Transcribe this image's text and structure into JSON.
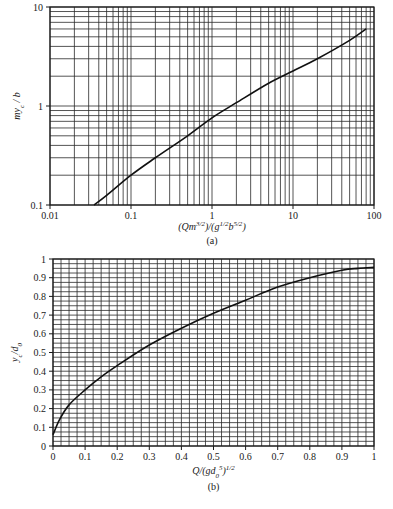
{
  "chart_data": [
    {
      "id": "a",
      "type": "line",
      "caption": "(a)",
      "xscale": "log",
      "yscale": "log",
      "xlim": [
        0.01,
        100
      ],
      "ylim": [
        0.1,
        10
      ],
      "xlabel": "(Qm^{3/2})/(g^{1/2}b^{5/2})",
      "xlabel_parts": [
        {
          "t": "(Qm",
          "s": "n"
        },
        {
          "t": "3/2",
          "s": "sup"
        },
        {
          "t": ")/(g",
          "s": "n"
        },
        {
          "t": "1/2",
          "s": "sup"
        },
        {
          "t": "b",
          "s": "n"
        },
        {
          "t": "5/2",
          "s": "sup"
        },
        {
          "t": ")",
          "s": "n"
        }
      ],
      "ylabel": "my_c / b",
      "ylabel_parts": [
        {
          "t": "my",
          "s": "n"
        },
        {
          "t": "c",
          "s": "sub"
        },
        {
          "t": " / b",
          "s": "n"
        }
      ],
      "xticks": [
        0.01,
        0.1,
        1,
        10,
        100
      ],
      "xtick_labels": [
        "0.01",
        "0.1",
        "1",
        "10",
        "100"
      ],
      "yticks": [
        0.1,
        1,
        10
      ],
      "ytick_labels": [
        "0.1",
        "1",
        "10"
      ],
      "grid": true,
      "series": [
        {
          "name": "my_c/b",
          "x": [
            0.035,
            0.05,
            0.1,
            0.2,
            0.5,
            1,
            2,
            5,
            10,
            20,
            50,
            80
          ],
          "y": [
            0.1,
            0.125,
            0.2,
            0.3,
            0.5,
            0.76,
            1.08,
            1.7,
            2.26,
            3.0,
            4.6,
            6.0
          ]
        }
      ]
    },
    {
      "id": "b",
      "type": "line",
      "caption": "(b)",
      "xscale": "linear",
      "yscale": "linear",
      "xlim": [
        0,
        1
      ],
      "ylim": [
        0,
        1
      ],
      "xlabel": "Q/(gd_0^5)^{1/2}",
      "xlabel_parts": [
        {
          "t": "Q/(gd",
          "s": "n"
        },
        {
          "t": "0",
          "s": "sub"
        },
        {
          "t": "5",
          "s": "sup"
        },
        {
          "t": ")",
          "s": "n"
        },
        {
          "t": "1/2",
          "s": "sup"
        }
      ],
      "ylabel": "y_c/d_0",
      "ylabel_parts": [
        {
          "t": "y",
          "s": "n"
        },
        {
          "t": "c",
          "s": "sub"
        },
        {
          "t": "/d",
          "s": "n"
        },
        {
          "t": "0",
          "s": "sub"
        }
      ],
      "xticks": [
        0,
        0.1,
        0.2,
        0.3,
        0.4,
        0.5,
        0.6,
        0.7,
        0.8,
        0.9,
        1
      ],
      "xtick_labels": [
        "0",
        "0.1",
        "0.2",
        "0.3",
        "0.4",
        "0.5",
        "0.6",
        "0.7",
        "0.8",
        "0.9",
        "1"
      ],
      "yticks": [
        0,
        0.1,
        0.2,
        0.3,
        0.4,
        0.5,
        0.6,
        0.7,
        0.8,
        0.9,
        1
      ],
      "ytick_labels": [
        "0",
        "0.1",
        "0.2",
        "0.3",
        "0.4",
        "0.5",
        "0.6",
        "0.7",
        "0.8",
        "0.9",
        "1"
      ],
      "grid": true,
      "grid_step": 0.025,
      "series": [
        {
          "name": "y_c/d_0",
          "x": [
            0,
            0.02,
            0.05,
            0.1,
            0.15,
            0.2,
            0.3,
            0.4,
            0.5,
            0.6,
            0.7,
            0.8,
            0.9,
            0.95,
            1.0
          ],
          "y": [
            0.06,
            0.14,
            0.22,
            0.3,
            0.37,
            0.43,
            0.54,
            0.63,
            0.71,
            0.78,
            0.85,
            0.9,
            0.94,
            0.95,
            0.955
          ]
        }
      ]
    }
  ]
}
